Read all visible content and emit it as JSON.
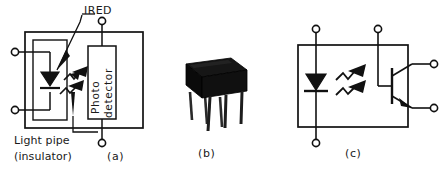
{
  "figure": {
    "stroke_color": "#111111",
    "fill_color": "#111111",
    "background": "#ffffff",
    "panels": [
      {
        "id": "a",
        "caption": "(a)",
        "description": "Cutaway functional diagram of an optocoupler showing the infrared emitting diode, light pipe insulator and photo detector inside a shielded package",
        "callouts": [
          {
            "name": "ired",
            "text": "IRED"
          },
          {
            "name": "light-pipe",
            "text_line1": "Light pipe",
            "text_line2": "(insulator)"
          }
        ],
        "blocks": [
          {
            "name": "photo-detector",
            "label_line1": "Photo",
            "label_line2": "detector"
          }
        ],
        "components": [
          {
            "name": "ired-diode",
            "type": "led"
          },
          {
            "name": "light-ray-upper",
            "type": "light-arrow"
          },
          {
            "name": "light-ray-lower",
            "type": "light-arrow"
          }
        ],
        "terminals": [
          {
            "name": "anode-terminal",
            "side": "left-top"
          },
          {
            "name": "cathode-terminal",
            "side": "left-bottom"
          },
          {
            "name": "detector-terminal-top",
            "side": "top"
          },
          {
            "name": "detector-terminal-bottom",
            "side": "bottom"
          }
        ]
      },
      {
        "id": "b",
        "caption": "(b)",
        "description": "Photograph of a 6-pin dual in-line plastic package optocoupler",
        "package": {
          "name": "dip-package",
          "pin_count": 6,
          "body_color": "#0d0d0d"
        }
      },
      {
        "id": "c",
        "caption": "(c)",
        "description": "Schematic symbol of an optocoupler with infrared emitting diode and phototransistor output",
        "components": [
          {
            "name": "ired-diode",
            "type": "led"
          },
          {
            "name": "phototransistor",
            "type": "npn-transistor"
          },
          {
            "name": "light-ray-upper",
            "type": "light-arrow"
          },
          {
            "name": "light-ray-lower",
            "type": "light-arrow"
          }
        ],
        "terminals": [
          {
            "name": "anode-terminal",
            "side": "top-left"
          },
          {
            "name": "cathode-terminal",
            "side": "bottom-left"
          },
          {
            "name": "base-terminal",
            "side": "top"
          },
          {
            "name": "collector-terminal",
            "side": "right-top"
          },
          {
            "name": "emitter-terminal",
            "side": "right-bottom"
          }
        ]
      }
    ]
  }
}
